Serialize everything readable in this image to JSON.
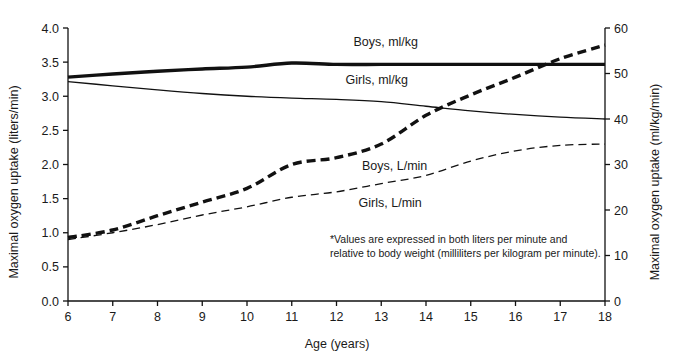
{
  "chart_data": {
    "type": "line",
    "title": "",
    "xlabel": "Age (years)",
    "ylabel": "Maximal oxygen uptake (liters/min)",
    "y2label": "Maximal oxygen uptake (ml/kg/min)",
    "grid": false,
    "legend_position": "inline-labels",
    "xlim": [
      6,
      18
    ],
    "ylim": [
      0.0,
      4.0
    ],
    "y2lim": [
      0,
      60
    ],
    "x": [
      6,
      7,
      8,
      9,
      10,
      11,
      12,
      13,
      14,
      15,
      16,
      17,
      18
    ],
    "xticks": [
      "6",
      "7",
      "8",
      "9",
      "10",
      "11",
      "12",
      "13",
      "14",
      "15",
      "16",
      "17",
      "18"
    ],
    "yticks": [
      "0.0",
      "0.5",
      "1.0",
      "1.5",
      "2.0",
      "2.5",
      "3.0",
      "3.5",
      "4.0"
    ],
    "y2ticks": [
      "0",
      "10",
      "20",
      "30",
      "40",
      "50",
      "60"
    ],
    "series": [
      {
        "name": "Boys, ml/kg",
        "axis": "right",
        "style": "solid-thick",
        "color": "#111111",
        "values": [
          49.2,
          49.9,
          50.5,
          51.0,
          51.4,
          52.3,
          52.0,
          52.0,
          52.0,
          52.0,
          52.0,
          52.0,
          52.0
        ],
        "label_x": 13.1,
        "label_y": 56.0
      },
      {
        "name": "Girls, ml/kg",
        "axis": "right",
        "style": "solid-thin",
        "color": "#111111",
        "values": [
          48.2,
          47.3,
          46.4,
          45.6,
          45.0,
          44.6,
          44.3,
          43.8,
          42.8,
          41.8,
          41.0,
          40.4,
          40.0
        ],
        "label_x": 12.9,
        "label_y": 47.8
      },
      {
        "name": "Boys, L/min",
        "axis": "left",
        "style": "dashed-thick",
        "color": "#111111",
        "values": [
          0.93,
          1.04,
          1.25,
          1.45,
          1.65,
          2.0,
          2.1,
          2.3,
          2.72,
          3.02,
          3.28,
          3.55,
          3.75
        ],
        "label_x": 13.3,
        "label_y": 1.92
      },
      {
        "name": "Girls, L/min",
        "axis": "left",
        "style": "dashed-thin",
        "color": "#111111",
        "values": [
          0.9,
          1.0,
          1.12,
          1.26,
          1.38,
          1.52,
          1.6,
          1.72,
          1.84,
          2.05,
          2.2,
          2.28,
          2.3
        ],
        "label_x": 13.2,
        "label_y": 1.38
      }
    ],
    "footnote_line1": "*Values are expressed in both liters per minute and",
    "footnote_line2": "relative to body weight (milliliters per kilogram per minute)."
  },
  "axes": {
    "left_title": "Maximal oxygen uptake (liters/min)",
    "right_title": "Maximal oxygen uptake (ml/kg/min)",
    "x_title": "Age (years)"
  },
  "colors": {
    "ink": "#111111",
    "background": "#ffffff"
  }
}
